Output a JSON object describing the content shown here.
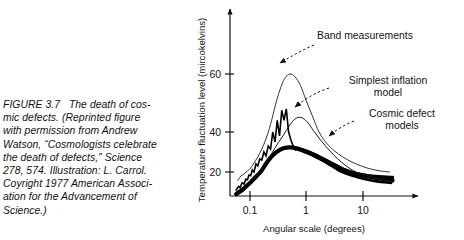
{
  "figure": {
    "caption_lines": [
      "FIGURE 3.7   The death of cos-",
      "mic defects. (Reprinted figure",
      "with permission from Andrew",
      "Watson, “Cosmologists celebrate",
      "the death of defects,” Science",
      "278, 574. Illustration: L. Carrol.",
      "Coyright 1977 American Associ-",
      "ation for the Advancement of",
      "Science.)"
    ],
    "caption_label": "FIGURE 3.7",
    "caption_text": "The death of cosmic defects. (Reprinted figure with permission from Andrew Watson, “Cosmologists celebrate the death of defects,” Science 278, 574. Illustration: L. Carrol. Coyright 1977 American Association for the Advancement of Science.)"
  },
  "chart_data": {
    "type": "line",
    "title": "",
    "xlabel": "Angular scale (degrees)",
    "ylabel": "Temperature fluctuation level (mircokelvins)",
    "xscale": "log",
    "xlim": [
      0.045,
      40
    ],
    "ylim": [
      0,
      78
    ],
    "xticks": [
      0.1,
      1,
      10
    ],
    "xticklabels": [
      "0.1",
      "1",
      "10"
    ],
    "yticks": [
      20,
      40,
      60
    ],
    "yticklabels": [
      "20",
      "40",
      "60"
    ],
    "grid": false,
    "legend": "annotations",
    "axis_style": "open-arrows",
    "annotations": [
      {
        "name": "band-measurements",
        "lines": [
          "Band measurements"
        ],
        "align": "start"
      },
      {
        "name": "simplest-inflation-model",
        "lines": [
          "Simplest inflation",
          "model"
        ],
        "align": "middle"
      },
      {
        "name": "cosmic-defect-models",
        "lines": [
          "Cosmic defect",
          "models"
        ],
        "align": "middle"
      }
    ],
    "series": [
      {
        "name": "Band measurements",
        "style": "thin-jagged",
        "linewidth": 1.0,
        "color": "#333333",
        "x": [
          0.062,
          0.07,
          0.08,
          0.092,
          0.105,
          0.12,
          0.14,
          0.165,
          0.195,
          0.235,
          0.285,
          0.345,
          0.42,
          0.52,
          0.64,
          0.8,
          1.0,
          1.3,
          1.7,
          2.3,
          3.2,
          4.5,
          6.5,
          9.5,
          14.0,
          21.0,
          30.0
        ],
        "values": [
          13.0,
          16.5,
          18.5,
          20.5,
          22.0,
          24.5,
          27.5,
          31.5,
          36.5,
          42.5,
          49.0,
          54.5,
          58.5,
          60.0,
          59.0,
          56.0,
          51.0,
          45.5,
          40.0,
          34.5,
          30.5,
          27.5,
          25.0,
          23.0,
          21.5,
          20.5,
          20.0
        ]
      },
      {
        "name": "Band measurements jagged band",
        "style": "jagged",
        "linewidth": 1.6,
        "color": "#000000",
        "x": [
          0.058,
          0.064,
          0.068,
          0.074,
          0.08,
          0.086,
          0.092,
          0.098,
          0.105,
          0.112,
          0.12,
          0.13,
          0.14,
          0.152,
          0.165,
          0.18,
          0.196,
          0.215,
          0.236,
          0.258,
          0.283,
          0.31,
          0.34,
          0.372,
          0.408,
          0.448,
          0.492,
          0.54,
          0.592,
          0.65
        ],
        "values": [
          5.0,
          8.0,
          7.0,
          11.0,
          10.0,
          14.0,
          13.5,
          17.5,
          17.0,
          21.0,
          20.0,
          24.0,
          23.0,
          26.5,
          26.0,
          30.0,
          28.0,
          33.0,
          31.5,
          40.0,
          35.0,
          44.0,
          38.0,
          47.5,
          44.0,
          48.0,
          40.0,
          36.0,
          33.0,
          31.0
        ]
      },
      {
        "name": "Simplest inflation model",
        "style": "thin-smooth",
        "linewidth": 1.0,
        "color": "#1a1a1a",
        "x": [
          0.058,
          0.07,
          0.085,
          0.105,
          0.13,
          0.16,
          0.2,
          0.25,
          0.32,
          0.4,
          0.5,
          0.64,
          0.82,
          1.05,
          1.35,
          1.75,
          2.3,
          3.1,
          4.2,
          5.8,
          8.0,
          11.0,
          15.5,
          21.0,
          28.0,
          35.0
        ],
        "values": [
          3.5,
          6.0,
          9.0,
          12.5,
          16.5,
          20.5,
          25.0,
          29.5,
          34.5,
          38.5,
          42.0,
          44.5,
          45.0,
          43.5,
          40.5,
          36.5,
          32.5,
          28.5,
          25.0,
          22.0,
          19.5,
          17.5,
          15.5,
          14.0,
          12.5,
          11.5
        ]
      },
      {
        "name": "Cosmic defect models",
        "style": "thick-bundle",
        "linewidth": 4.2,
        "color": "#000000",
        "x": [
          0.058,
          0.07,
          0.085,
          0.105,
          0.13,
          0.162,
          0.2,
          0.25,
          0.32,
          0.41,
          0.53,
          0.68,
          0.88,
          1.15,
          1.5,
          2.0,
          2.7,
          3.7,
          5.1,
          7.0,
          9.6,
          13.5,
          19.0,
          26.0,
          34.0
        ],
        "values": [
          1.5,
          4.0,
          7.5,
          11.5,
          16.0,
          20.5,
          24.5,
          28.0,
          30.5,
          32.0,
          32.3,
          31.8,
          30.8,
          29.5,
          28.0,
          26.2,
          24.3,
          22.4,
          20.6,
          18.9,
          17.4,
          16.0,
          14.8,
          13.8,
          13.0
        ]
      },
      {
        "name": "Cosmic defect models variant 2",
        "style": "thick-bundle",
        "linewidth": 3.4,
        "color": "#000000",
        "x": [
          0.9,
          1.2,
          1.6,
          2.2,
          3.0,
          4.1,
          5.6,
          7.7,
          10.5,
          14.5,
          20.0,
          27.0,
          34.0
        ],
        "values": [
          31.0,
          29.6,
          28.0,
          26.0,
          24.0,
          22.0,
          20.2,
          18.6,
          17.4,
          16.6,
          16.0,
          15.6,
          15.4
        ]
      },
      {
        "name": "Cosmic defect models variant 3",
        "style": "thick-bundle",
        "linewidth": 2.6,
        "color": "#000000",
        "x": [
          1.0,
          1.4,
          1.95,
          2.7,
          3.7,
          5.1,
          7.0,
          9.6,
          13.2,
          18.0,
          24.5,
          32.0
        ],
        "values": [
          30.0,
          28.0,
          25.8,
          23.4,
          21.0,
          18.7,
          16.6,
          14.8,
          13.3,
          12.2,
          11.4,
          10.9
        ]
      }
    ]
  }
}
